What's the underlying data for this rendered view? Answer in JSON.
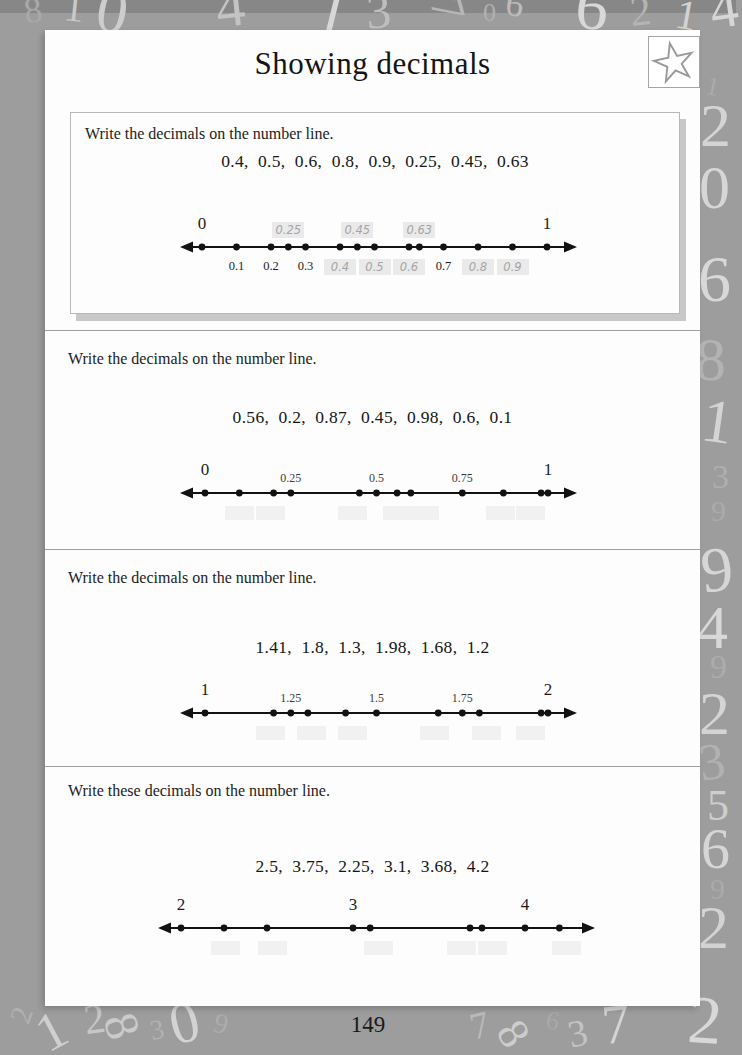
{
  "page": {
    "title": "Showing decimals",
    "page_number": "149"
  },
  "style_colors": {
    "background": "#9d9d9d",
    "top_strip": "#878787",
    "paper": "#fdfdfd",
    "line_color": "#121212",
    "answer_text": "#a5a5a5",
    "answer_box": "#eaeaea",
    "empty_box": "#f1f1f1"
  },
  "sections": [
    {
      "prompt": "Write the decimals on the number line.",
      "decimals_list": "0.4,  0.5,  0.6,  0.8,  0.9,  0.25,  0.45,  0.63",
      "number_line": {
        "min": 0,
        "max": 1,
        "endpoints": [
          {
            "v": 0,
            "t": "0"
          },
          {
            "v": 1,
            "t": "1"
          }
        ],
        "tick_labels": [],
        "dots": [
          0,
          0.1,
          0.2,
          0.25,
          0.3,
          0.4,
          0.45,
          0.5,
          0.6,
          0.63,
          0.7,
          0.8,
          0.9,
          1
        ],
        "printed_below": [
          {
            "v": 0.1,
            "t": "0.1"
          },
          {
            "v": 0.2,
            "t": "0.2"
          },
          {
            "v": 0.3,
            "t": "0.3"
          },
          {
            "v": 0.7,
            "t": "0.7"
          }
        ],
        "answers_above": [
          {
            "v": 0.25,
            "t": "0.25"
          },
          {
            "v": 0.45,
            "t": "0.45"
          },
          {
            "v": 0.63,
            "t": "0.63"
          }
        ],
        "answers_below": [
          {
            "v": 0.4,
            "t": "0.4"
          },
          {
            "v": 0.5,
            "t": "0.5"
          },
          {
            "v": 0.6,
            "t": "0.6"
          },
          {
            "v": 0.8,
            "t": "0.8"
          },
          {
            "v": 0.9,
            "t": "0.9"
          }
        ],
        "empty_boxes": []
      }
    },
    {
      "prompt": "Write the decimals on the number line.",
      "decimals_list": "0.56,  0.2,  0.87,  0.45,  0.98,  0.6,  0.1",
      "number_line": {
        "min": 0,
        "max": 1,
        "endpoints": [
          {
            "v": 0,
            "t": "0"
          },
          {
            "v": 1,
            "t": "1"
          }
        ],
        "tick_labels": [
          {
            "v": 0.25,
            "t": "0.25"
          },
          {
            "v": 0.5,
            "t": "0.5"
          },
          {
            "v": 0.75,
            "t": "0.75"
          }
        ],
        "dots": [
          0,
          0.1,
          0.2,
          0.25,
          0.45,
          0.5,
          0.56,
          0.6,
          0.75,
          0.87,
          0.98,
          1
        ],
        "printed_below": [],
        "answers_above": [],
        "answers_below": [],
        "empty_boxes": [
          0.1,
          0.19,
          0.43,
          0.56,
          0.64,
          0.86,
          0.95
        ]
      }
    },
    {
      "prompt": "Write the decimals on the number line.",
      "decimals_list": "1.41,  1.8,  1.3,  1.98,  1.68,  1.2",
      "number_line": {
        "min": 1,
        "max": 2,
        "endpoints": [
          {
            "v": 1,
            "t": "1"
          },
          {
            "v": 2,
            "t": "2"
          }
        ],
        "tick_labels": [
          {
            "v": 1.25,
            "t": "1.25"
          },
          {
            "v": 1.5,
            "t": "1.5"
          },
          {
            "v": 1.75,
            "t": "1.75"
          }
        ],
        "dots": [
          1,
          1.2,
          1.25,
          1.3,
          1.41,
          1.5,
          1.68,
          1.75,
          1.8,
          1.98,
          2
        ],
        "printed_below": [],
        "answers_above": [],
        "answers_below": [],
        "empty_boxes": [
          1.19,
          1.31,
          1.43,
          1.67,
          1.82,
          1.95
        ]
      }
    },
    {
      "prompt": "Write these decimals on the number line.",
      "decimals_list": "2.5,  3.75,  2.25,  3.1,  3.68,  4.2",
      "number_line": {
        "min": 2,
        "max": 4,
        "endpoints": [
          {
            "v": 2,
            "t": "2"
          },
          {
            "v": 3,
            "t": "3"
          },
          {
            "v": 4,
            "t": "4"
          }
        ],
        "tick_labels": [],
        "dots": [
          2,
          2.25,
          2.5,
          3,
          3.1,
          3.68,
          3.75,
          4,
          4.2
        ],
        "printed_below": [],
        "answers_above": [],
        "answers_below": [],
        "empty_boxes": [
          2.26,
          2.53,
          3.15,
          3.63,
          3.81,
          4.24
        ]
      }
    }
  ],
  "background_numbers": [
    {
      "t": "8",
      "x": 24,
      "y": -8,
      "s": 36,
      "c": "#a9a9a9",
      "r": -8
    },
    {
      "t": "1",
      "x": 64,
      "y": -12,
      "s": 40,
      "c": "#c9c9c9",
      "r": 6
    },
    {
      "t": "0",
      "x": 97,
      "y": -20,
      "s": 62,
      "c": "#cdcdcd",
      "r": 10
    },
    {
      "t": "4",
      "x": 216,
      "y": -22,
      "s": 58,
      "c": "#c3c3c3",
      "r": -6
    },
    {
      "t": "1",
      "x": 316,
      "y": -18,
      "s": 64,
      "c": "#d7d7d7",
      "r": 14
    },
    {
      "t": "3",
      "x": 366,
      "y": -14,
      "s": 50,
      "c": "#bebebe",
      "r": -4
    },
    {
      "t": "7",
      "x": 436,
      "y": -14,
      "s": 46,
      "c": "#b6b6b6",
      "r": 75
    },
    {
      "t": "0",
      "x": 483,
      "y": 0,
      "s": 26,
      "c": "#b0b0b0",
      "r": 0
    },
    {
      "t": "6",
      "x": 506,
      "y": -14,
      "s": 36,
      "c": "#bcbcbc",
      "r": 10
    },
    {
      "t": "6",
      "x": 576,
      "y": -26,
      "s": 66,
      "c": "#d8d8d8",
      "r": 8
    },
    {
      "t": "2",
      "x": 630,
      "y": -10,
      "s": 42,
      "c": "#b4b4b4",
      "r": -6
    },
    {
      "t": "1",
      "x": 676,
      "y": -6,
      "s": 42,
      "c": "#d2d2d2",
      "r": 10
    },
    {
      "t": "4",
      "x": 710,
      "y": -20,
      "s": 56,
      "c": "#d6d6d6",
      "r": -8
    },
    {
      "t": "1",
      "x": 706,
      "y": 74,
      "s": 26,
      "c": "#ababab",
      "r": 12
    },
    {
      "t": "2",
      "x": 700,
      "y": 94,
      "s": 62,
      "c": "#d4d4d4",
      "r": 0
    },
    {
      "t": "0",
      "x": 699,
      "y": 156,
      "s": 62,
      "c": "#d6d6d6",
      "r": 0
    },
    {
      "t": "6",
      "x": 698,
      "y": 246,
      "s": 66,
      "c": "#d8d8d8",
      "r": 0
    },
    {
      "t": "8",
      "x": 695,
      "y": 328,
      "s": 62,
      "c": "#b3b3b3",
      "r": 0
    },
    {
      "t": "1",
      "x": 702,
      "y": 390,
      "s": 62,
      "c": "#d4d4d4",
      "r": 8
    },
    {
      "t": "3",
      "x": 712,
      "y": 460,
      "s": 34,
      "c": "#afafaf",
      "r": 0
    },
    {
      "t": "9",
      "x": 711,
      "y": 496,
      "s": 30,
      "c": "#ababab",
      "r": 0
    },
    {
      "t": "9",
      "x": 701,
      "y": 538,
      "s": 64,
      "c": "#d6d6d6",
      "r": -6
    },
    {
      "t": "4",
      "x": 697,
      "y": 596,
      "s": 62,
      "c": "#d8d8d8",
      "r": 0
    },
    {
      "t": "9",
      "x": 710,
      "y": 650,
      "s": 34,
      "c": "#acacac",
      "r": 0
    },
    {
      "t": "2",
      "x": 699,
      "y": 682,
      "s": 62,
      "c": "#d4d4d4",
      "r": 0
    },
    {
      "t": "3",
      "x": 699,
      "y": 736,
      "s": 52,
      "c": "#b1b1b1",
      "r": -8
    },
    {
      "t": "5",
      "x": 707,
      "y": 784,
      "s": 44,
      "c": "#cecece",
      "r": 0
    },
    {
      "t": "6",
      "x": 701,
      "y": 820,
      "s": 58,
      "c": "#d6d6d6",
      "r": 0
    },
    {
      "t": "9",
      "x": 710,
      "y": 874,
      "s": 30,
      "c": "#aaaaaa",
      "r": 0
    },
    {
      "t": "2",
      "x": 698,
      "y": 896,
      "s": 62,
      "c": "#d3d3d3",
      "r": 0
    },
    {
      "t": "2",
      "x": 14,
      "y": 1000,
      "s": 30,
      "c": "#b1b1b1",
      "r": -70
    },
    {
      "t": "1",
      "x": 38,
      "y": 1004,
      "s": 54,
      "c": "#cfcfcf",
      "r": -28
    },
    {
      "t": "2",
      "x": 84,
      "y": 998,
      "s": 42,
      "c": "#c7c7c7",
      "r": -8
    },
    {
      "t": "8",
      "x": 110,
      "y": 1002,
      "s": 48,
      "c": "#cacaca",
      "r": 72
    },
    {
      "t": "3",
      "x": 150,
      "y": 1016,
      "s": 28,
      "c": "#b2b2b2",
      "r": -10
    },
    {
      "t": "0",
      "x": 170,
      "y": 994,
      "s": 58,
      "c": "#d3d3d3",
      "r": -14
    },
    {
      "t": "9",
      "x": 214,
      "y": 1010,
      "s": 28,
      "c": "#acacac",
      "r": 14
    },
    {
      "t": "7",
      "x": 470,
      "y": 1006,
      "s": 38,
      "c": "#bababa",
      "r": -14
    },
    {
      "t": "8",
      "x": 502,
      "y": 1012,
      "s": 44,
      "c": "#cdcdcd",
      "r": 58
    },
    {
      "t": "6",
      "x": 546,
      "y": 1008,
      "s": 26,
      "c": "#a9a9a9",
      "r": 10
    },
    {
      "t": "3",
      "x": 568,
      "y": 1014,
      "s": 38,
      "c": "#c3c3c3",
      "r": -12
    },
    {
      "t": "7",
      "x": 602,
      "y": 996,
      "s": 56,
      "c": "#d4d4d4",
      "r": -6
    },
    {
      "t": "2",
      "x": 688,
      "y": 986,
      "s": 68,
      "c": "#d8d8d8",
      "r": 4
    }
  ]
}
